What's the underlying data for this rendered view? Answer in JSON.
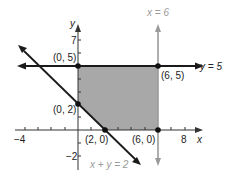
{
  "graph": {
    "axes": {
      "x_label": "x",
      "y_label": "y",
      "x_ticks": [
        {
          "value": -4,
          "label": "−4"
        },
        {
          "value": 8,
          "label": "8"
        }
      ],
      "y_ticks": [
        {
          "value": 7,
          "label": "7"
        },
        {
          "value": -2,
          "label": "−2"
        }
      ]
    },
    "lines": [
      {
        "label": "y = 5",
        "color": "#1a1a1a"
      },
      {
        "label": "x = 6",
        "color": "#9a9a9a"
      },
      {
        "label": "x + y = 2",
        "color": "#1a1a1a"
      }
    ],
    "points": [
      {
        "label": "(0, 5)"
      },
      {
        "label": "(6, 5)"
      },
      {
        "label": "(0, 2)"
      },
      {
        "label": "(2, 0)"
      },
      {
        "label": "(6, 0)"
      }
    ],
    "shaded_region_color": "#a8a8a8"
  }
}
